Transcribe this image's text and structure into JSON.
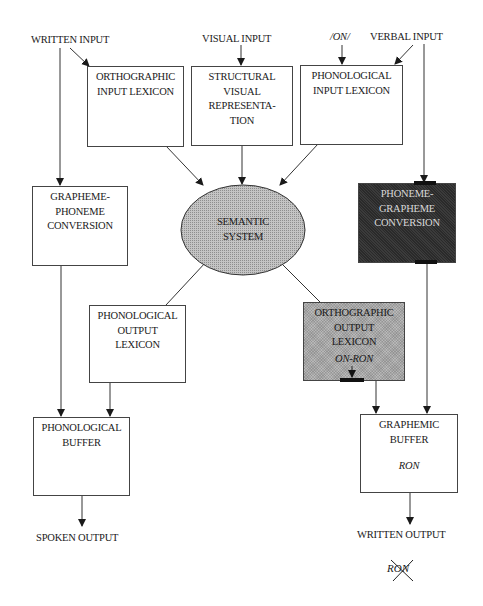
{
  "diagram": {
    "type": "cognitive-neuropsychological model of reading, writing and spelling",
    "inputs": {
      "written_input": "WRITTEN INPUT",
      "visual_input": "VISUAL INPUT",
      "phoneme_stimulus": "/ON/",
      "verbal_input": "VERBAL INPUT"
    },
    "boxes": {
      "orthographic_input_lexicon": [
        "ORTHOGRAPHIC",
        "INPUT LEXICON"
      ],
      "structural_visual_representation": [
        "STRUCTURAL",
        "VISUAL",
        "REPRESENTA-",
        "TION"
      ],
      "phonological_input_lexicon": [
        "PHONOLOGICAL",
        "INPUT LEXICON"
      ],
      "semantic_system": [
        "SEMANTIC",
        "SYSTEM"
      ],
      "grapheme_phoneme_conversion": [
        "GRAPHEME-",
        "PHONEME",
        "CONVERSION"
      ],
      "phoneme_grapheme_conversion": [
        "PHONEME-",
        "GRAPHEME",
        "CONVERSION"
      ],
      "phonological_output_lexicon": [
        "PHONOLOGICAL",
        "OUTPUT",
        "LEXICON"
      ],
      "orthographic_output_lexicon": [
        "ORTHOGRAPHIC",
        "OUTPUT",
        "LEXICON"
      ],
      "orthographic_output_item": "ON-RON",
      "phonological_buffer": [
        "PHONOLOGICAL",
        "BUFFER"
      ],
      "graphemic_buffer": [
        "GRAPHEMIC",
        "BUFFER"
      ],
      "graphemic_buffer_item": "RON"
    },
    "outputs": {
      "spoken_output": "SPOKEN OUTPUT",
      "written_output": "WRITTEN OUTPUT",
      "crossed_out_response": "RON"
    },
    "colors": {
      "line": "#333333",
      "damaged_dark": "#2a2a2a",
      "partial_grey": "#b8b8b8",
      "background": "#ffffff"
    }
  }
}
